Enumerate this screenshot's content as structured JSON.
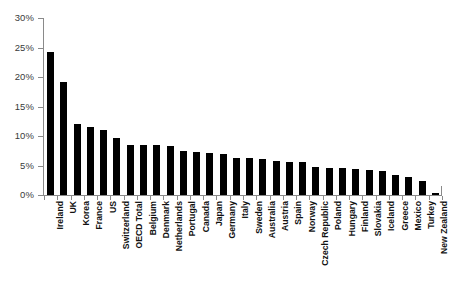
{
  "chart_data": {
    "type": "bar",
    "title": "",
    "subtitle": "",
    "xlabel": "",
    "ylabel": "",
    "ylim": [
      0,
      30
    ],
    "ytick_labels": [
      "0%",
      "5%",
      "10%",
      "15%",
      "20%",
      "25%",
      "30%"
    ],
    "ytick_values": [
      0,
      5,
      10,
      15,
      20,
      25,
      30
    ],
    "grid": false,
    "legend": null,
    "legend_position": "none",
    "bar_color": "#000000",
    "axis_color": "#8a8a8a",
    "categories": [
      "Ireland",
      "UK",
      "Korea",
      "France",
      "US",
      "Switzerland",
      "OECD Total",
      "Belgium",
      "Denmark",
      "Netherlands",
      "Portugal",
      "Canada",
      "Japan",
      "Germany",
      "Italy",
      "Sweden",
      "Australia",
      "Austria",
      "Spain",
      "Norway",
      "Czech Republic",
      "Poland",
      "Hungary",
      "Finland",
      "Slovakia",
      "Iceland",
      "Greece",
      "Mexico",
      "Turkey",
      "New Zealand"
    ],
    "values": [
      24.2,
      19.1,
      12.0,
      11.5,
      11.0,
      9.6,
      8.5,
      8.4,
      8.4,
      8.3,
      7.4,
      7.3,
      7.2,
      7.0,
      6.3,
      6.2,
      6.1,
      5.8,
      5.6,
      5.6,
      4.7,
      4.5,
      4.5,
      4.4,
      4.3,
      4.1,
      3.4,
      3.1,
      2.3,
      0.3
    ]
  }
}
